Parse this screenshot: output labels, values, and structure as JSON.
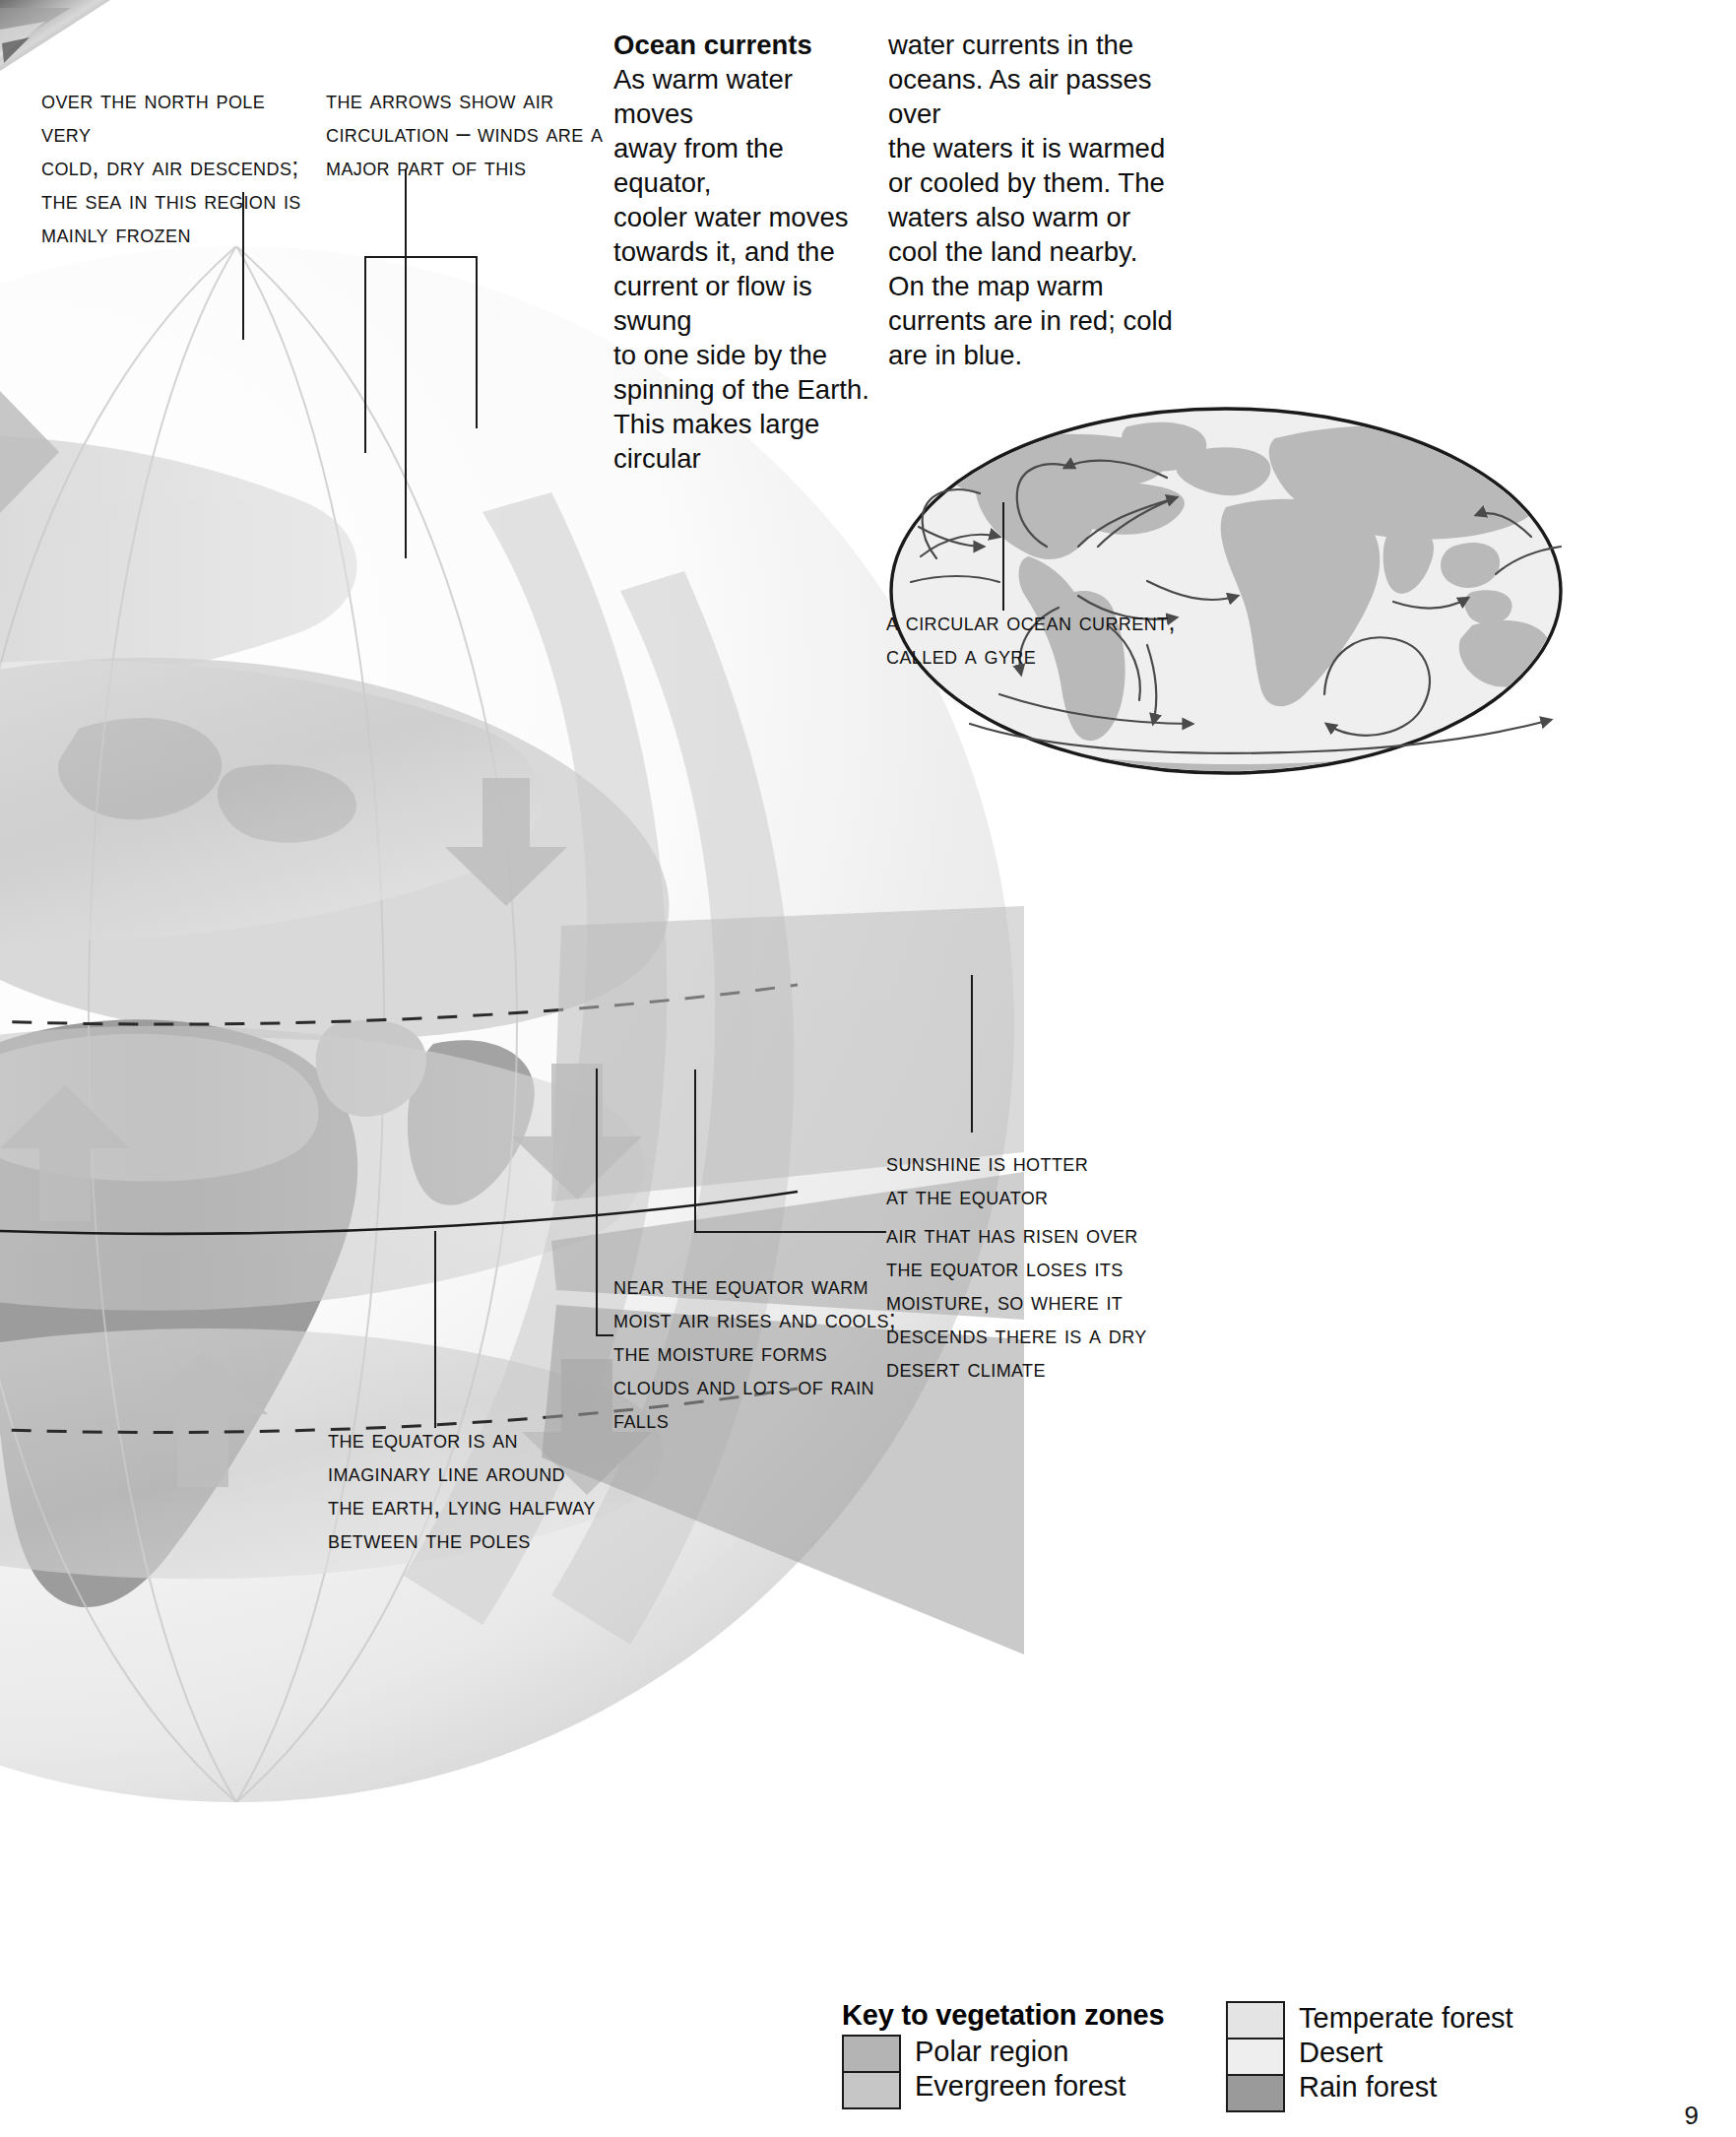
{
  "page": {
    "number": "9",
    "corner_photo_alt": "ice-cliff-photo"
  },
  "callouts": [
    {
      "id": "north-pole",
      "text": "Over the north pole very cold, dry air descends; the sea in this region is mainly frozen",
      "lines": [
        "Over the north pole very",
        "cold, dry air descends;",
        "the sea in this region is",
        "mainly frozen"
      ]
    },
    {
      "id": "arrows-air-circulation",
      "text": "The arrows show air circulation – winds are a major part of this",
      "lines": [
        "The arrows show air",
        "circulation – winds are a",
        "major part of this"
      ]
    },
    {
      "id": "gyre",
      "text": "A circular ocean current, called a gyre",
      "lines": [
        "A circular ocean current,",
        "called a gyre"
      ]
    },
    {
      "id": "sunshine-hotter",
      "text": "Sunshine is hotter at the equator",
      "lines": [
        "Sunshine is hotter",
        "at the equator"
      ]
    },
    {
      "id": "desert-climate",
      "text": "Air that has risen over the equator loses its moisture, so where it descends there is a dry desert climate",
      "lines": [
        "Air that has risen over",
        "the equator loses its",
        "moisture, so where it",
        "descends there is a dry",
        "desert climate"
      ]
    },
    {
      "id": "near-equator-rain",
      "text": "Near the equator warm moist air rises and cools; the moisture forms clouds and lots of rain falls",
      "lines": [
        "Near the equator warm",
        "moist air rises and cools;",
        "the moisture forms",
        "clouds and lots of rain",
        "falls"
      ]
    },
    {
      "id": "equator-definition",
      "text": "The equator is an imaginary line around the Earth, lying halfway between the poles",
      "lines": [
        "The equator is an",
        "imaginary line around",
        "the Earth, lying halfway",
        "between the poles"
      ]
    }
  ],
  "ocean_currents": {
    "heading": "Ocean currents",
    "column_1": [
      "As warm water moves",
      "away from the equator,",
      "cooler water moves",
      "towards it, and the",
      "current or flow is swung",
      "to one side by the",
      "spinning of the Earth.",
      "This makes large circular"
    ],
    "column_2": [
      "water currents in the",
      "oceans. As air passes over",
      "the waters it is warmed",
      "or cooled by them. The",
      "waters also warm or",
      "cool the land nearby.",
      "On the map warm",
      "currents are in red; cold",
      "are in blue."
    ]
  },
  "legend": {
    "title": "Key to vegetation zones",
    "left_items": [
      {
        "label": "Polar region",
        "color": "#b4b4b4"
      },
      {
        "label": "Evergreen forest",
        "color": "#c6c6c6"
      }
    ],
    "right_items": [
      {
        "label": "Temperate forest",
        "color": "#e4e4e4"
      },
      {
        "label": "Desert",
        "color": "#eeeeee"
      },
      {
        "label": "Rain forest",
        "color": "#9a9a9a"
      }
    ]
  },
  "colors": {
    "ink": "#111111",
    "land": "#b9b9b9",
    "ocean": "#efefef",
    "arrow": "#3a3a3a",
    "globe_land_dark": "#9e9e9e",
    "globe_land_light": "#d6d6d6",
    "wind_band": "#cfcfcf",
    "sun_beam": "#b6b6b6"
  }
}
